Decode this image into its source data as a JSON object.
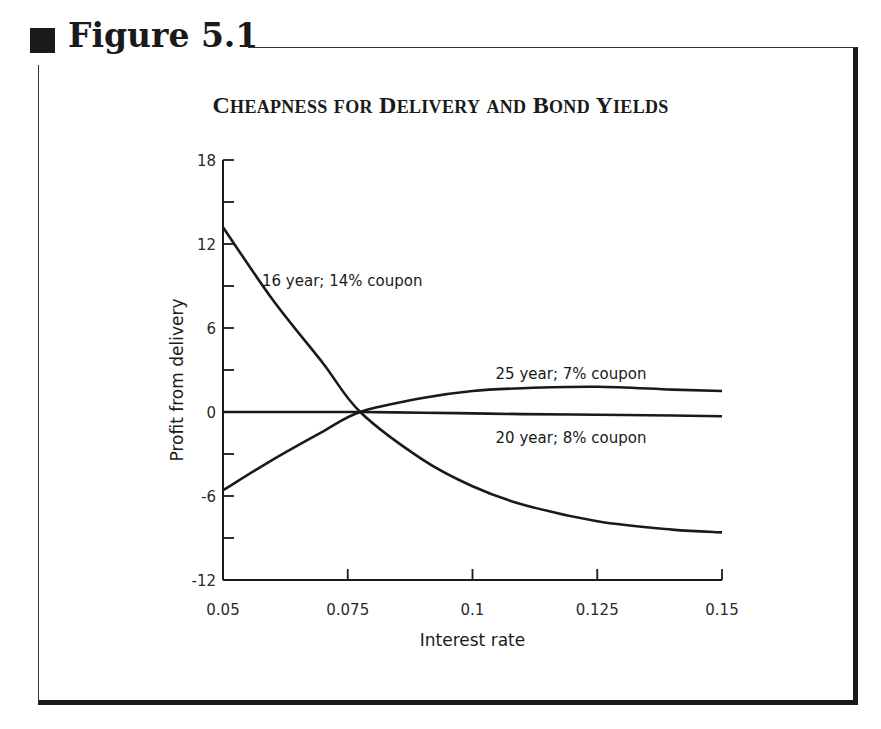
{
  "figure": {
    "label": "Figure 5.1"
  },
  "chart_data": {
    "type": "line",
    "title": "Cheapness for Delivery and Bond Yields",
    "xlabel": "Interest rate",
    "ylabel": "Profit from delivery",
    "xlim": [
      0.05,
      0.15
    ],
    "ylim": [
      -12,
      18
    ],
    "xticks": [
      "0.05",
      "0.075",
      "0.1",
      "0.125",
      "0.15"
    ],
    "yticks": [
      "18",
      "12",
      "6",
      "0",
      "-6",
      "-12"
    ],
    "grid": false,
    "legend": "inline labels",
    "x": [
      0.05,
      0.06,
      0.07,
      0.0775,
      0.09,
      0.1,
      0.11,
      0.125,
      0.14,
      0.15
    ],
    "series": [
      {
        "name": "16 year; 14% coupon",
        "values": [
          13.2,
          8.0,
          3.5,
          0.0,
          -3.4,
          -5.3,
          -6.6,
          -7.8,
          -8.4,
          -8.6
        ]
      },
      {
        "name": "25 year; 7% coupon",
        "values": [
          -5.6,
          -3.4,
          -1.4,
          0.0,
          1.0,
          1.5,
          1.7,
          1.8,
          1.6,
          1.5
        ]
      },
      {
        "name": "20 year; 8% coupon",
        "values": [
          0.0,
          0.0,
          0.0,
          0.0,
          -0.05,
          -0.1,
          -0.15,
          -0.2,
          -0.25,
          -0.3
        ]
      }
    ]
  }
}
